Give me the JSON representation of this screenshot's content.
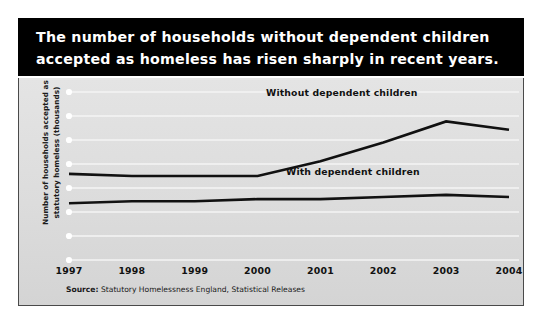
{
  "title": "The number of households without dependent children\naccepted as homeless has risen sharply in recent years.",
  "source": {
    "prefix": "Source:",
    "text": " Statutory Homelessness England, Statistical Releases"
  },
  "colors": {
    "title_band": "#000000",
    "title_text": "#ffffff",
    "panel_background": "#dcdcdc",
    "gridline": "#f4f4f4",
    "series_line": "#111111",
    "axis_dot": "#ffffff",
    "panel_border": "#4a4a4a"
  },
  "chart_data": {
    "type": "line",
    "title": "The number of households without dependent children accepted as homeless has risen sharply in recent years.",
    "xlabel": "",
    "ylabel": "Number of households accepted as\nstatutory homeless (thousands)",
    "categories": [
      "1997",
      "1998",
      "1999",
      "2000",
      "2001",
      "2002",
      "2003",
      "2004"
    ],
    "grid": true,
    "gridlines": 8,
    "legend": "inline-labels",
    "ylim": [
      0,
      80
    ],
    "series": [
      {
        "name": "Without dependent children",
        "values": [
          41,
          40,
          40,
          40,
          47,
          56,
          66,
          62
        ]
      },
      {
        "name": "With dependent children",
        "values": [
          27,
          28,
          28,
          29,
          29,
          30,
          31,
          30
        ]
      }
    ]
  }
}
